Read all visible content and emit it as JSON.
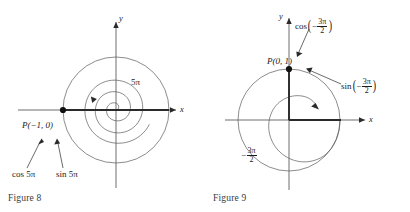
{
  "page": {
    "background_color": "#ffffff",
    "ink_color": "#1a1a1a",
    "curve_color": "#555555"
  },
  "figures": [
    {
      "id": "figure-8",
      "caption": "Figure 8",
      "axis_x_label": "x",
      "axis_y_label": "y",
      "point_label": "P(−1, 0)",
      "angle_label": "5π",
      "cos_label": "cos 5π",
      "sin_label": "sin 5π",
      "point_coords": {
        "x": -1,
        "y": 0
      },
      "angle_radians_display": "5π",
      "spiral_turns": 2.5,
      "spiral_direction": "counterclockwise",
      "terminal_side": "negative x-axis"
    },
    {
      "id": "figure-9",
      "caption": "Figure 9",
      "axis_x_label": "x",
      "axis_y_label": "y",
      "point_label": "P(0, 1)",
      "angle_label_sign": "−",
      "angle_label_num": "3π",
      "angle_label_den": "2",
      "cos_label_fn": "cos",
      "cos_label_sign": "−",
      "cos_label_num": "3π",
      "cos_label_den": "2",
      "sin_label_fn": "sin",
      "sin_label_sign": "−",
      "sin_label_num": "3π",
      "sin_label_den": "2",
      "point_coords": {
        "x": 0,
        "y": 1
      },
      "angle_radians_display": "−3π/2",
      "spiral_turns": 0.75,
      "spiral_direction": "clockwise",
      "terminal_side": "positive y-axis"
    }
  ]
}
